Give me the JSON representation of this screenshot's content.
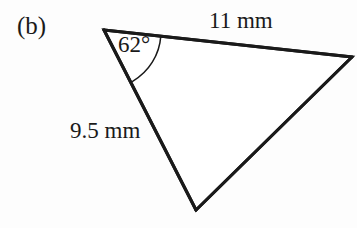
{
  "figure": {
    "part_label": "(b)",
    "type": "triangle-diagram",
    "background_color": "#fdfdfd",
    "stroke_color": "#1a1a1a",
    "stroke_width": 3,
    "annotations": {
      "angle": {
        "value": "62",
        "unit": "°",
        "text": "62°",
        "at_vertex": "top-left",
        "arc": true
      },
      "side_top": {
        "value": "11",
        "unit": "mm",
        "text": "11 mm",
        "side": "top-edge"
      },
      "side_left": {
        "value": "9.5",
        "unit": "mm",
        "text": "9.5 mm",
        "side": "left-edge"
      }
    },
    "geometry": {
      "vertices": {
        "A": {
          "x": 104,
          "y": 30,
          "name": "top-left-vertex"
        },
        "B": {
          "x": 352,
          "y": 57,
          "name": "right-vertex"
        },
        "C": {
          "x": 196,
          "y": 210,
          "name": "bottom-vertex"
        }
      },
      "edges": [
        {
          "name": "edge-AB",
          "from": "A",
          "to": "B",
          "labelled": "11 mm"
        },
        {
          "name": "edge-AC",
          "from": "A",
          "to": "C",
          "labelled": "9.5 mm"
        },
        {
          "name": "edge-BC",
          "from": "B",
          "to": "C",
          "labelled": ""
        }
      ],
      "angle_arc": {
        "center": {
          "x": 104,
          "y": 30
        },
        "radius": 57,
        "start": {
          "x": 160,
          "y": 36
        },
        "end": {
          "x": 133,
          "y": 81
        }
      }
    }
  }
}
